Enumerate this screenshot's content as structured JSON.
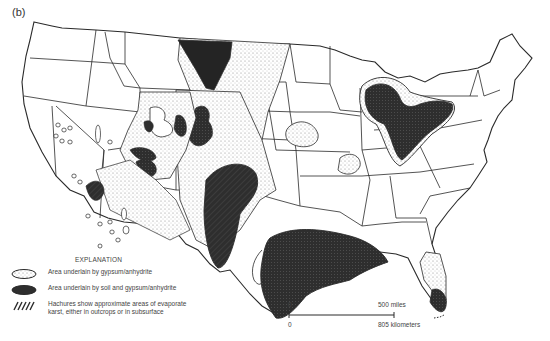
{
  "figure": {
    "panel_label": "(b)"
  },
  "legend": {
    "title": "EXPLANATION",
    "items": [
      {
        "symbol": "open-stippled-outline",
        "label": "Area underlain by gypsum/anhydrite"
      },
      {
        "symbol": "dark-filled-area",
        "label": "Area underlain by soil and gypsum/anhydrite"
      },
      {
        "symbol": "hachures",
        "label_line1": "Hachures show approximate areas of evaporate",
        "label_line2": "karst, either in outcrops or in subsurface"
      }
    ]
  },
  "scale_bar": {
    "zero_top": "0",
    "miles_label": "500 miles",
    "zero_bottom": "0",
    "km_label": "805 kilometers"
  },
  "colors": {
    "background": "#ffffff",
    "line": "#2a2a2a",
    "dark_fill": "#2e2e2e",
    "stipple": "#9a9a9a"
  }
}
